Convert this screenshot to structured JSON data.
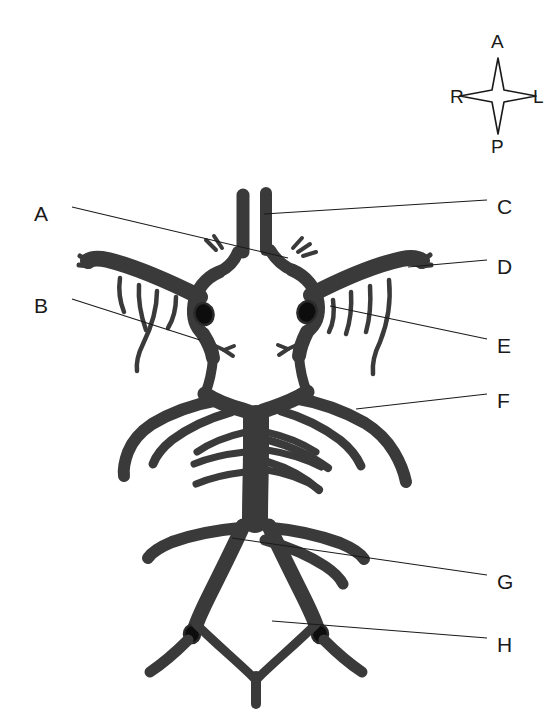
{
  "figure": {
    "kind": "anatomical-line-diagram",
    "background_color": "#ffffff",
    "vessel_fill_color": "#3a3a3a",
    "vessel_outline_color": "#2b2b2b",
    "lumen_color": "#0d0d0d",
    "leader_line_color": "#1a1a1a",
    "label_text_color": "#1a1a1a"
  },
  "compass": {
    "name": "orientation-compass",
    "anterior": "A",
    "left": "L",
    "posterior": "P",
    "right": "R"
  },
  "labels": [
    {
      "id": "A",
      "text": "A",
      "side": "left",
      "x": 34,
      "y": 203
    },
    {
      "id": "B",
      "text": "B",
      "side": "left",
      "x": 34,
      "y": 295
    },
    {
      "id": "C",
      "text": "C",
      "side": "right",
      "x": 497,
      "y": 196
    },
    {
      "id": "D",
      "text": "D",
      "side": "right",
      "x": 497,
      "y": 256
    },
    {
      "id": "E",
      "text": "E",
      "side": "right",
      "x": 497,
      "y": 335
    },
    {
      "id": "F",
      "text": "F",
      "side": "right",
      "x": 497,
      "y": 390
    },
    {
      "id": "G",
      "text": "G",
      "side": "right",
      "x": 497,
      "y": 571
    },
    {
      "id": "H",
      "text": "H",
      "side": "right",
      "x": 497,
      "y": 634
    }
  ],
  "leader_lines": [
    {
      "label": "A",
      "from_x": 72,
      "from_y": 207,
      "to_x": 288,
      "to_y": 258
    },
    {
      "label": "B",
      "from_x": 72,
      "from_y": 299,
      "to_x": 200,
      "to_y": 340
    },
    {
      "label": "C",
      "from_x": 487,
      "from_y": 200,
      "to_x": 264,
      "to_y": 214
    },
    {
      "label": "D",
      "from_x": 487,
      "from_y": 260,
      "to_x": 408,
      "to_y": 267
    },
    {
      "label": "E",
      "from_x": 487,
      "from_y": 339,
      "to_x": 330,
      "to_y": 306
    },
    {
      "label": "F",
      "from_x": 487,
      "from_y": 394,
      "to_x": 356,
      "to_y": 409
    },
    {
      "label": "G",
      "from_x": 487,
      "from_y": 575,
      "to_x": 232,
      "to_y": 538
    },
    {
      "label": "H",
      "from_x": 487,
      "from_y": 638,
      "to_x": 272,
      "to_y": 621
    }
  ]
}
